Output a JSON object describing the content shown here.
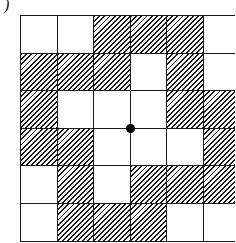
{
  "figure": {
    "label": ")",
    "rows": 6,
    "cols": 6,
    "cell_width": 36.5,
    "cell_height": 37.6,
    "hatch_color": "#1a1a1a",
    "line_color": "#1a1a1a",
    "grid": [
      [
        0,
        0,
        1,
        1,
        1,
        0
      ],
      [
        1,
        1,
        1,
        0,
        1,
        0
      ],
      [
        1,
        0,
        0,
        0,
        1,
        1
      ],
      [
        1,
        1,
        0,
        0,
        0,
        1
      ],
      [
        0,
        1,
        0,
        1,
        1,
        1
      ],
      [
        0,
        1,
        1,
        1,
        0,
        0
      ]
    ],
    "center_dot": {
      "row_line": 3,
      "col_line": 3
    }
  }
}
